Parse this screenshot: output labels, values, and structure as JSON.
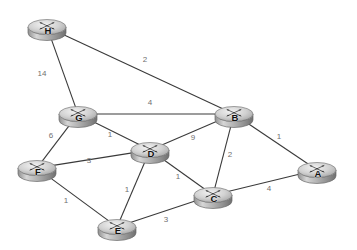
{
  "diagram": {
    "background_color": "#ffffff",
    "edge_color": "#3a3a3a",
    "weight_color": "#6f6f6f",
    "node_fill_color": "#c9c9c9",
    "node_label_color": "#111111",
    "icon_name": "router-icon"
  },
  "chart_data": {
    "type": "graph",
    "directed": false,
    "weighted": true,
    "node_count": 8,
    "edge_count": 13,
    "nodes": [
      {
        "id": "H",
        "label": "H",
        "x": 47,
        "y": 27
      },
      {
        "id": "G",
        "label": "G",
        "x": 78,
        "y": 114
      },
      {
        "id": "B",
        "label": "B",
        "x": 234,
        "y": 114
      },
      {
        "id": "D",
        "label": "D",
        "x": 150,
        "y": 150
      },
      {
        "id": "F",
        "label": "F",
        "x": 37,
        "y": 168
      },
      {
        "id": "A",
        "label": "A",
        "x": 317,
        "y": 170
      },
      {
        "id": "C",
        "label": "C",
        "x": 213,
        "y": 195
      },
      {
        "id": "E",
        "label": "E",
        "x": 117,
        "y": 227
      }
    ],
    "edges": [
      {
        "source": "H",
        "target": "G",
        "weight": 14,
        "label_x": 42,
        "label_y": 74
      },
      {
        "source": "H",
        "target": "B",
        "weight": 2,
        "label_x": 145,
        "label_y": 60
      },
      {
        "source": "G",
        "target": "B",
        "weight": 4,
        "label_x": 150,
        "label_y": 103
      },
      {
        "source": "G",
        "target": "F",
        "weight": 6,
        "label_x": 51,
        "label_y": 136
      },
      {
        "source": "G",
        "target": "D",
        "weight": 1,
        "label_x": 110,
        "label_y": 135
      },
      {
        "source": "D",
        "target": "B",
        "weight": 9,
        "label_x": 193,
        "label_y": 138
      },
      {
        "source": "B",
        "target": "A",
        "weight": 1,
        "label_x": 279,
        "label_y": 137
      },
      {
        "source": "B",
        "target": "C",
        "weight": 2,
        "label_x": 230,
        "label_y": 155
      },
      {
        "source": "F",
        "target": "D",
        "weight": 3,
        "label_x": 89,
        "label_y": 161
      },
      {
        "source": "D",
        "target": "C",
        "weight": 1,
        "label_x": 178,
        "label_y": 177
      },
      {
        "source": "D",
        "target": "E",
        "weight": 1,
        "label_x": 127,
        "label_y": 190
      },
      {
        "source": "F",
        "target": "E",
        "weight": 1,
        "label_x": 66,
        "label_y": 201
      },
      {
        "source": "E",
        "target": "C",
        "weight": 3,
        "label_x": 166,
        "label_y": 220
      },
      {
        "source": "C",
        "target": "A",
        "weight": 4,
        "label_x": 269,
        "label_y": 189
      }
    ]
  }
}
